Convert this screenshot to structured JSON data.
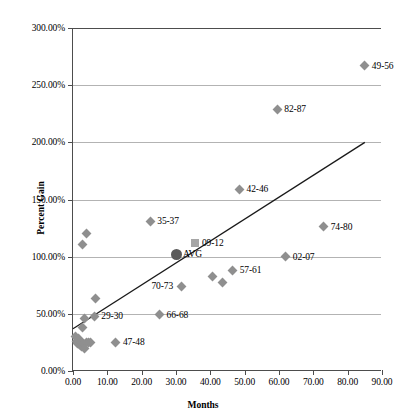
{
  "chart_data": {
    "type": "scatter",
    "title": "",
    "xlabel": "Months",
    "ylabel": "Percent Gain",
    "xlim": [
      0,
      90
    ],
    "ylim": [
      0,
      3.0
    ],
    "grid": true,
    "legend": "none",
    "xticks": [
      "0.00",
      "10.00",
      "20.00",
      "30.00",
      "40.00",
      "50.00",
      "60.00",
      "70.00",
      "80.00",
      "90.00"
    ],
    "xtick_values": [
      0,
      10,
      20,
      30,
      40,
      50,
      60,
      70,
      80,
      90
    ],
    "yticks": [
      "0.00%",
      "50.00%",
      "100.00%",
      "150.00%",
      "200.00%",
      "250.00%",
      "300.00%"
    ],
    "ytick_values": [
      0,
      0.5,
      1.0,
      1.5,
      2.0,
      2.5,
      3.0
    ],
    "marker_color": "#8f8f8f",
    "avg_marker_color": "#5a5a5a",
    "square_marker_color": "#a6a6a6",
    "trendline_color": "#1a1a1a",
    "gridline_color": "#b3b3b3",
    "axis_color": "#4d4d4d",
    "trendline": {
      "x_start": 0.0,
      "y_start": 0.37,
      "x_end": 85.0,
      "y_end": 2.0
    },
    "points": [
      {
        "label": "",
        "x": 0.6,
        "y": 0.3,
        "marker": "diamond",
        "label_pos": "none"
      },
      {
        "label": "",
        "x": 0.9,
        "y": 0.26,
        "marker": "diamond",
        "label_pos": "none"
      },
      {
        "label": "",
        "x": 1.2,
        "y": 0.24,
        "marker": "diamond",
        "label_pos": "none"
      },
      {
        "label": "",
        "x": 1.6,
        "y": 0.28,
        "marker": "diamond",
        "label_pos": "none"
      },
      {
        "label": "",
        "x": 1.9,
        "y": 0.23,
        "marker": "diamond",
        "label_pos": "none"
      },
      {
        "label": "",
        "x": 2.3,
        "y": 0.26,
        "marker": "diamond",
        "label_pos": "none"
      },
      {
        "label": "",
        "x": 2.6,
        "y": 0.21,
        "marker": "diamond",
        "label_pos": "none"
      },
      {
        "label": "",
        "x": 3.0,
        "y": 0.24,
        "marker": "diamond",
        "label_pos": "none"
      },
      {
        "label": "",
        "x": 3.4,
        "y": 0.2,
        "marker": "diamond",
        "label_pos": "none"
      },
      {
        "label": "",
        "x": 4.0,
        "y": 0.25,
        "marker": "diamond",
        "label_pos": "none"
      },
      {
        "label": "",
        "x": 4.6,
        "y": 0.25,
        "marker": "diamond",
        "label_pos": "none"
      },
      {
        "label": "",
        "x": 5.1,
        "y": 0.25,
        "marker": "diamond",
        "label_pos": "none"
      },
      {
        "label": "",
        "x": 2.8,
        "y": 0.38,
        "marker": "diamond",
        "label_pos": "none"
      },
      {
        "label": "",
        "x": 3.3,
        "y": 0.46,
        "marker": "diamond",
        "label_pos": "none"
      },
      {
        "label": "",
        "x": 2.8,
        "y": 1.11,
        "marker": "diamond",
        "label_pos": "none"
      },
      {
        "label": "",
        "x": 3.8,
        "y": 1.2,
        "marker": "diamond",
        "label_pos": "none"
      },
      {
        "label": "",
        "x": 6.6,
        "y": 0.63,
        "marker": "diamond",
        "label_pos": "none"
      },
      {
        "label": "29-30",
        "x": 6.2,
        "y": 0.48,
        "marker": "diamond",
        "label_pos": "right"
      },
      {
        "label": "47-48",
        "x": 12.5,
        "y": 0.25,
        "marker": "diamond",
        "label_pos": "right"
      },
      {
        "label": "66-68",
        "x": 25.2,
        "y": 0.49,
        "marker": "diamond",
        "label_pos": "right"
      },
      {
        "label": "35-37",
        "x": 22.5,
        "y": 1.31,
        "marker": "diamond",
        "label_pos": "right"
      },
      {
        "label": "AVG",
        "x": 30.0,
        "y": 1.02,
        "marker": "circle",
        "label_pos": "right"
      },
      {
        "label": "09-12",
        "x": 35.5,
        "y": 1.12,
        "marker": "square",
        "label_pos": "right"
      },
      {
        "label": "70-73",
        "x": 31.5,
        "y": 0.74,
        "marker": "diamond",
        "label_pos": "left"
      },
      {
        "label": "",
        "x": 40.5,
        "y": 0.83,
        "marker": "diamond",
        "label_pos": "none"
      },
      {
        "label": "",
        "x": 43.5,
        "y": 0.77,
        "marker": "diamond",
        "label_pos": "none"
      },
      {
        "label": "57-61",
        "x": 46.5,
        "y": 0.88,
        "marker": "diamond",
        "label_pos": "right"
      },
      {
        "label": "42-46",
        "x": 48.5,
        "y": 1.59,
        "marker": "diamond",
        "label_pos": "right"
      },
      {
        "label": "82-87",
        "x": 59.5,
        "y": 2.29,
        "marker": "diamond",
        "label_pos": "right"
      },
      {
        "label": "02-07",
        "x": 62.0,
        "y": 1.0,
        "marker": "diamond",
        "label_pos": "right"
      },
      {
        "label": "74-80",
        "x": 73.0,
        "y": 1.26,
        "marker": "diamond",
        "label_pos": "right"
      },
      {
        "label": "49-56",
        "x": 85.0,
        "y": 2.67,
        "marker": "diamond",
        "label_pos": "right"
      }
    ]
  }
}
